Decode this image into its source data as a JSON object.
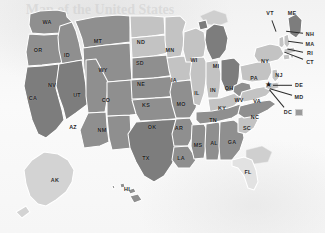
{
  "map": {
    "title": "United States map with state abbreviations",
    "projection": "albers-usa",
    "background_color": "#f7f7f7",
    "border_color": "#ffffff",
    "shades": {
      "dark": "#7d7d7d",
      "medium": "#8f8f8f",
      "light": "#c3c3c3",
      "lighter": "#d3d3d3",
      "very_light": "#e2e2e2",
      "offshore": "#cfcfcf"
    },
    "dc_marker": {
      "symbol": "★",
      "label": "DC",
      "swatch_color": "#9a9a9a"
    },
    "states": [
      {
        "code": "WA",
        "name": "Washington",
        "shade": "medium",
        "label_x": 47,
        "label_y": 22
      },
      {
        "code": "OR",
        "name": "Oregon",
        "shade": "medium",
        "label_x": 38,
        "label_y": 50
      },
      {
        "code": "ID",
        "name": "Idaho",
        "shade": "medium",
        "label_x": 67,
        "label_y": 55
      },
      {
        "code": "MT",
        "name": "Montana",
        "shade": "medium",
        "label_x": 98,
        "label_y": 41
      },
      {
        "code": "WY",
        "name": "Wyoming",
        "shade": "medium",
        "label_x": 103,
        "label_y": 70
      },
      {
        "code": "CA",
        "name": "California",
        "shade": "dark",
        "label_x": 33,
        "label_y": 98
      },
      {
        "code": "NV",
        "name": "Nevada",
        "shade": "dark",
        "label_x": 52,
        "label_y": 85
      },
      {
        "code": "UT",
        "name": "Utah",
        "shade": "medium",
        "label_x": 77,
        "label_y": 95
      },
      {
        "code": "AZ",
        "name": "Arizona",
        "shade": "medium",
        "label_x": 73,
        "label_y": 127
      },
      {
        "code": "NM",
        "name": "New Mexico",
        "shade": "medium",
        "label_x": 102,
        "label_y": 130
      },
      {
        "code": "CO",
        "name": "Colorado",
        "shade": "medium",
        "label_x": 106,
        "label_y": 100
      },
      {
        "code": "ND",
        "name": "North Dakota",
        "shade": "light",
        "label_x": 141,
        "label_y": 42
      },
      {
        "code": "SD",
        "name": "South Dakota",
        "shade": "light",
        "label_x": 140,
        "label_y": 63
      },
      {
        "code": "NE",
        "name": "Nebraska",
        "shade": "medium",
        "label_x": 141,
        "label_y": 84
      },
      {
        "code": "KS",
        "name": "Kansas",
        "shade": "medium",
        "label_x": 146,
        "label_y": 105
      },
      {
        "code": "OK",
        "name": "Oklahoma",
        "shade": "medium",
        "label_x": 152,
        "label_y": 127
      },
      {
        "code": "TX",
        "name": "Texas",
        "shade": "dark",
        "label_x": 146,
        "label_y": 158
      },
      {
        "code": "MN",
        "name": "Minnesota",
        "shade": "light",
        "label_x": 170,
        "label_y": 50
      },
      {
        "code": "IA",
        "name": "Iowa",
        "shade": "light",
        "label_x": 174,
        "label_y": 80
      },
      {
        "code": "MO",
        "name": "Missouri",
        "shade": "medium",
        "label_x": 181,
        "label_y": 104
      },
      {
        "code": "AR",
        "name": "Arkansas",
        "shade": "medium",
        "label_x": 179,
        "label_y": 128
      },
      {
        "code": "LA",
        "name": "Louisiana",
        "shade": "medium",
        "label_x": 181,
        "label_y": 158
      },
      {
        "code": "WI",
        "name": "Wisconsin",
        "shade": "light",
        "label_x": 194,
        "label_y": 60
      },
      {
        "code": "IL",
        "name": "Illinois",
        "shade": "light",
        "label_x": 197,
        "label_y": 93
      },
      {
        "code": "MS",
        "name": "Mississippi",
        "shade": "medium",
        "label_x": 198,
        "label_y": 145
      },
      {
        "code": "MI",
        "name": "Michigan",
        "shade": "dark",
        "label_x": 216,
        "label_y": 66
      },
      {
        "code": "IN",
        "name": "Indiana",
        "shade": "light",
        "label_x": 213,
        "label_y": 90
      },
      {
        "code": "KY",
        "name": "Kentucky",
        "shade": "light",
        "label_x": 222,
        "label_y": 108
      },
      {
        "code": "TN",
        "name": "Tennessee",
        "shade": "medium",
        "label_x": 213,
        "label_y": 120
      },
      {
        "code": "AL",
        "name": "Alabama",
        "shade": "medium",
        "label_x": 214,
        "label_y": 143
      },
      {
        "code": "OH",
        "name": "Ohio",
        "shade": "dark",
        "label_x": 229,
        "label_y": 88
      },
      {
        "code": "GA",
        "name": "Georgia",
        "shade": "medium",
        "label_x": 232,
        "label_y": 142
      },
      {
        "code": "FL",
        "name": "Florida",
        "shade": "very_light",
        "label_x": 248,
        "label_y": 172
      },
      {
        "code": "WV",
        "name": "West Virginia",
        "shade": "medium",
        "label_x": 239,
        "label_y": 100
      },
      {
        "code": "SC",
        "name": "South Carolina",
        "shade": "light",
        "label_x": 247,
        "label_y": 128
      },
      {
        "code": "NC",
        "name": "North Carolina",
        "shade": "medium",
        "label_x": 255,
        "label_y": 117
      },
      {
        "code": "VA",
        "name": "Virginia",
        "shade": "light",
        "label_x": 257,
        "label_y": 101
      },
      {
        "code": "PA",
        "name": "Pennsylvania",
        "shade": "light",
        "label_x": 254,
        "label_y": 78
      },
      {
        "code": "NY",
        "name": "New York",
        "shade": "light",
        "label_x": 265,
        "label_y": 61
      },
      {
        "code": "AK",
        "name": "Alaska",
        "shade": "lighter",
        "label_x": 55,
        "label_y": 180
      },
      {
        "code": "HI",
        "name": "Hawaii",
        "shade": "medium",
        "label_x": 127,
        "label_y": 189
      }
    ],
    "callouts": [
      {
        "code": "VT",
        "name": "Vermont",
        "label_x": 270,
        "label_y": 13,
        "tip_x": 277,
        "tip_y": 32
      },
      {
        "code": "ME",
        "name": "Maine",
        "label_x": 292,
        "label_y": 13,
        "tip_x": 292,
        "tip_y": 13
      },
      {
        "code": "NH",
        "name": "New Hampshire",
        "label_x": 310,
        "label_y": 34,
        "tip_x": 285,
        "tip_y": 31
      },
      {
        "code": "MA",
        "name": "Massachusetts",
        "label_x": 310,
        "label_y": 44,
        "tip_x": 287,
        "tip_y": 41
      },
      {
        "code": "RI",
        "name": "Rhode Island",
        "label_x": 310,
        "label_y": 53,
        "tip_x": 287,
        "tip_y": 48
      },
      {
        "code": "CT",
        "name": "Connecticut",
        "label_x": 310,
        "label_y": 62,
        "tip_x": 284,
        "tip_y": 52
      },
      {
        "code": "NJ",
        "name": "New Jersey",
        "label_x": 279,
        "label_y": 75,
        "tip_x": 279,
        "tip_y": 75
      },
      {
        "code": "DE",
        "name": "Delaware",
        "label_x": 299,
        "label_y": 85,
        "tip_x": 272,
        "tip_y": 85
      },
      {
        "code": "MD",
        "name": "Maryland",
        "label_x": 299,
        "label_y": 97,
        "tip_x": 269,
        "tip_y": 88
      },
      {
        "code": "DC",
        "name": "District of Columbia",
        "label_x": 288,
        "label_y": 112,
        "tip_x": 268,
        "tip_y": 88
      }
    ],
    "watermark": "Map of the United States"
  }
}
